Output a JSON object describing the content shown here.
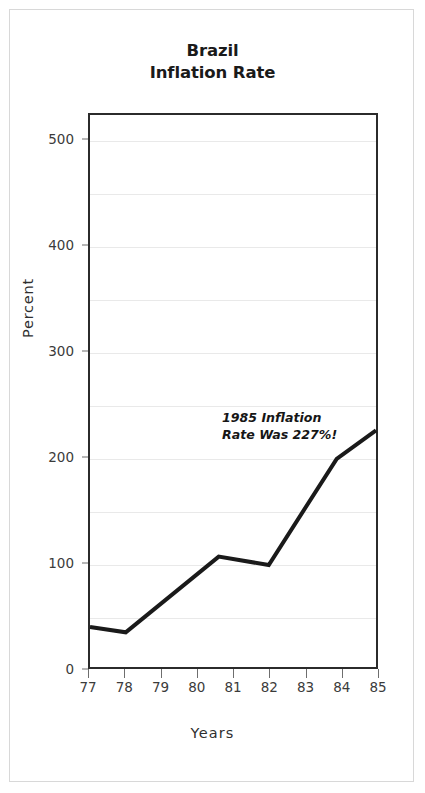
{
  "figure": {
    "title_line1": "Brazil",
    "title_line2": "Inflation Rate",
    "frame_color": "#d8d8d8",
    "background": "#ffffff"
  },
  "annotation": {
    "line1": "1985 Inflation",
    "line2": "Rate Was 227%!"
  },
  "axes": {
    "y_title": "Percent",
    "x_title": "Years",
    "y_ticks": [
      "0",
      "100",
      "200",
      "300",
      "400",
      "500"
    ],
    "x_ticks": [
      "77",
      "78",
      "79",
      "80",
      "81",
      "82",
      "83",
      "84",
      "85"
    ]
  },
  "chart_data": {
    "type": "line",
    "title": "Brazil Inflation Rate",
    "xlabel": "Years",
    "ylabel": "Percent",
    "xlim": [
      77,
      85
    ],
    "ylim": [
      0,
      525
    ],
    "xticks": [
      77,
      78,
      79,
      80,
      81,
      82,
      83,
      84,
      85
    ],
    "yticks": [
      0,
      100,
      200,
      300,
      400,
      500
    ],
    "minor_gridlines": [
      50,
      100,
      150,
      200,
      250,
      300,
      350,
      400,
      450,
      500
    ],
    "grid": true,
    "legend": "none",
    "line_color": "#1a1a1a",
    "line_width": 4,
    "x": [
      77,
      78,
      80.6,
      82,
      83.9,
      85
    ],
    "values": [
      38,
      33,
      105,
      97,
      198,
      225
    ],
    "series": [
      {
        "name": "Inflation Rate",
        "x": [
          77,
          78,
          80.6,
          82,
          83.9,
          85
        ],
        "values": [
          38,
          33,
          105,
          97,
          198,
          225
        ]
      }
    ],
    "annotations": [
      {
        "text": "1985 Inflation Rate Was 227%!",
        "x": 82.5,
        "y": 250
      }
    ]
  }
}
